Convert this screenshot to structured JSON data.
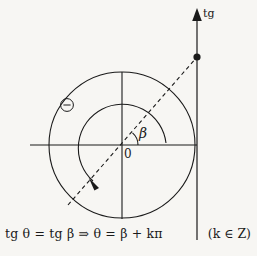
{
  "diagram": {
    "axis_label_tg": "tg",
    "origin_label": "0",
    "angle_label": "β",
    "theta_marker": "θ",
    "stroke_color": "#1a1a1a",
    "background_color": "#f7f6f3"
  },
  "formula": {
    "lhs_fn": "tg",
    "lhs_arg": "θ",
    "equals": "=",
    "rhs_fn": "tg",
    "rhs_arg": "β",
    "implies": "⇒",
    "result_lhs": "θ",
    "result_equals": "=",
    "result_rhs": "β + kπ",
    "full_text": "tg θ = tg β  ⇒  θ = β + kπ",
    "condition": "(k ∈ Z)"
  },
  "geometry": {
    "origin": {
      "x": 122,
      "y": 145
    },
    "outer_circle_radius": 73,
    "inner_arc_radius": 44,
    "beta_arc_radius": 16,
    "tangent_line_x": 197,
    "tangent_point": {
      "x": 197,
      "y": 57
    },
    "dashed_ray_start": {
      "x": 68,
      "y": 205
    },
    "dashed_ray_end": {
      "x": 197,
      "y": 57
    },
    "beta_degrees": 49
  }
}
